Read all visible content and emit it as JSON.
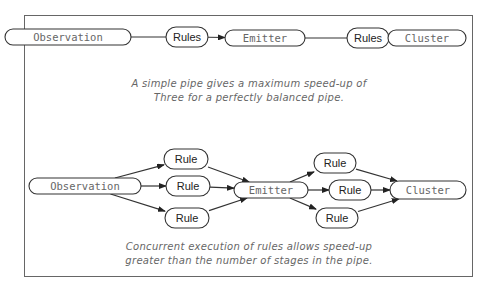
{
  "diagram": {
    "top_pipeline": {
      "nodes": [
        {
          "id": "obs1",
          "label": "Observation",
          "style": "mono"
        },
        {
          "id": "rules1",
          "label": "Rules",
          "style": "bold"
        },
        {
          "id": "emit1",
          "label": "Emitter",
          "style": "mono"
        },
        {
          "id": "rules2",
          "label": "Rules",
          "style": "bold"
        },
        {
          "id": "clus1",
          "label": "Cluster",
          "style": "mono"
        }
      ],
      "edges": [
        {
          "from": "obs1",
          "to": "rules1",
          "arrow": false
        },
        {
          "from": "rules1",
          "to": "emit1",
          "arrow": true
        },
        {
          "from": "emit1",
          "to": "rules2",
          "arrow": false
        },
        {
          "from": "rules2",
          "to": "clus1",
          "arrow": true
        }
      ],
      "caption": [
        "A simple pipe gives a maximum speed-up of",
        "Three for a perfectly balanced pipe."
      ]
    },
    "bottom_pipeline": {
      "nodes": [
        {
          "id": "obs2",
          "label": "Observation",
          "style": "mono"
        },
        {
          "id": "r1a",
          "label": "Rule",
          "style": "bold"
        },
        {
          "id": "r1b",
          "label": "Rule",
          "style": "bold"
        },
        {
          "id": "r1c",
          "label": "Rule",
          "style": "bold"
        },
        {
          "id": "emit2",
          "label": "Emitter",
          "style": "mono"
        },
        {
          "id": "r2a",
          "label": "Rule",
          "style": "bold"
        },
        {
          "id": "r2b",
          "label": "Rule",
          "style": "bold"
        },
        {
          "id": "r2c",
          "label": "Rule",
          "style": "bold"
        },
        {
          "id": "clus2",
          "label": "Cluster",
          "style": "mono"
        }
      ],
      "edges": [
        {
          "from": "obs2",
          "to": "r1a",
          "arrow": true
        },
        {
          "from": "obs2",
          "to": "r1b",
          "arrow": true
        },
        {
          "from": "obs2",
          "to": "r1c",
          "arrow": true
        },
        {
          "from": "r1a",
          "to": "emit2",
          "arrow": true
        },
        {
          "from": "r1b",
          "to": "emit2",
          "arrow": true
        },
        {
          "from": "r1c",
          "to": "emit2",
          "arrow": true
        },
        {
          "from": "emit2",
          "to": "r2a",
          "arrow": true
        },
        {
          "from": "emit2",
          "to": "r2b",
          "arrow": true
        },
        {
          "from": "emit2",
          "to": "r2c",
          "arrow": true
        },
        {
          "from": "r2a",
          "to": "clus2",
          "arrow": true
        },
        {
          "from": "r2b",
          "to": "clus2",
          "arrow": true
        },
        {
          "from": "r2c",
          "to": "clus2",
          "arrow": true
        }
      ],
      "caption": [
        "Concurrent execution of rules allows speed-up",
        "greater than the number of stages in the pipe."
      ]
    }
  }
}
